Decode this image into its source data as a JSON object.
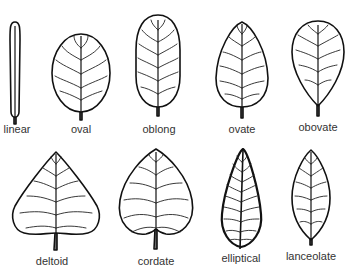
{
  "diagram": {
    "title": "",
    "leaves": [
      {
        "label": "linear",
        "row": 1,
        "col": 1
      },
      {
        "label": "oval",
        "row": 1,
        "col": 2
      },
      {
        "label": "oblong",
        "row": 1,
        "col": 3
      },
      {
        "label": "ovate",
        "row": 1,
        "col": 4
      },
      {
        "label": "obovate",
        "row": 1,
        "col": 5
      },
      {
        "label": "deltoid",
        "row": 2,
        "col": 1
      },
      {
        "label": "cordate",
        "row": 2,
        "col": 2
      },
      {
        "label": "elliptical",
        "row": 2,
        "col": 3
      },
      {
        "label": "lanceolate",
        "row": 2,
        "col": 4
      }
    ],
    "colors": {
      "line": "#111111",
      "background": "#ffffff",
      "text": "#333333"
    }
  }
}
